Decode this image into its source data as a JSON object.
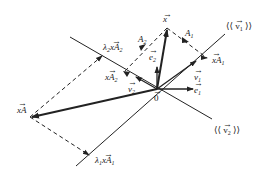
{
  "diagram": {
    "colors": {
      "stroke": "#222222",
      "background": "#ffffff"
    },
    "points": {
      "origin": {
        "label": "0",
        "x": 157,
        "y": 89
      },
      "x": {
        "label": "x",
        "x": 167,
        "y": 28
      },
      "A1": {
        "label": "A1",
        "x": 186,
        "y": 40
      },
      "A2": {
        "label": "A2",
        "x": 143,
        "y": 47
      },
      "xA1": {
        "label": "xA1",
        "x": 207,
        "y": 58
      },
      "xA2": {
        "label": "xA2",
        "x": 124,
        "y": 72
      },
      "lambda1_xA1": {
        "label": "λ1xA1",
        "x": 89,
        "y": 155
      },
      "lambda2_xA2": {
        "label": "λ2xA2",
        "x": 102,
        "y": 56
      },
      "xA": {
        "label": "xA",
        "x": 30,
        "y": 117
      },
      "v1": {
        "label": "v1",
        "x": 196,
        "y": 61
      },
      "v2": {
        "label": "v2",
        "x": 136,
        "y": 77
      },
      "e1": {
        "label": "e1",
        "x": 193,
        "y": 89
      },
      "e2": {
        "label": "e2",
        "x": 157,
        "y": 67
      }
    },
    "labels": {
      "x": "x",
      "A1": "A",
      "A1_sub": "1",
      "A2": "A",
      "A2_sub": "2",
      "xA1": "xA",
      "xA1_sub": "1",
      "xA2": "xA",
      "xA2_sub": "2",
      "lambda1_xA1": "λ",
      "lambda1_sub": "1",
      "lambda1_rest": "xA",
      "lambda1_rest_sub": "1",
      "lambda2_xA2": "λ",
      "lambda2_sub": "2",
      "lambda2_rest": "xA",
      "lambda2_rest_sub": "2",
      "xA": "xA",
      "v1": "v",
      "v1_sub": "1",
      "v2": "v",
      "v2_sub": "2",
      "e1": "e",
      "e1_sub": "1",
      "e2": "e",
      "e2_sub": "2",
      "origin": "0",
      "span_v1": "⟨⟨ v",
      "span_v1_sub": "1",
      "span_v1_close": " ⟩⟩",
      "span_v2": "⟨⟨ v",
      "span_v2_sub": "2",
      "span_v2_close": " ⟩⟩"
    },
    "lines": [
      {
        "name": "span-v1-line",
        "from": [
          76,
          166
        ],
        "to": [
          225,
          34
        ],
        "style": "solid"
      },
      {
        "name": "span-v2-line",
        "from": [
          70,
          37
        ],
        "to": [
          212,
          119
        ],
        "style": "solid"
      },
      {
        "name": "x-vector",
        "from": [
          157,
          89
        ],
        "to": [
          167,
          28
        ],
        "style": "thick"
      },
      {
        "name": "xA-vector",
        "from": [
          157,
          89
        ],
        "to": [
          30,
          117
        ],
        "style": "thick"
      },
      {
        "name": "x-to-xA1",
        "from": [
          167,
          28
        ],
        "to": [
          207,
          58
        ],
        "style": "dashed"
      },
      {
        "name": "x-to-xA2",
        "from": [
          167,
          28
        ],
        "to": [
          124,
          72
        ],
        "style": "dashed"
      },
      {
        "name": "xA-to-lambda1",
        "from": [
          30,
          117
        ],
        "to": [
          89,
          155
        ],
        "style": "dashed"
      },
      {
        "name": "xA-to-lambda2",
        "from": [
          30,
          117
        ],
        "to": [
          102,
          56
        ],
        "style": "dashed"
      }
    ]
  }
}
